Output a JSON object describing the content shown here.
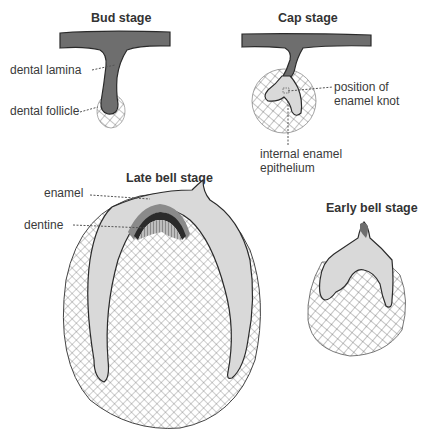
{
  "figure": {
    "stages": [
      {
        "id": "bud",
        "title": "Bud stage"
      },
      {
        "id": "cap",
        "title": "Cap stage"
      },
      {
        "id": "late-bell",
        "title": "Late bell stage"
      },
      {
        "id": "early-bell",
        "title": "Early bell stage"
      }
    ],
    "labels": {
      "dental_lamina": "dental lamina",
      "dental_follicle": "dental follicle",
      "enamel_knot_line1": "position of",
      "enamel_knot_line2": "enamel knot",
      "iee_line1": "internal enamel",
      "iee_line2": "epithelium",
      "enamel": "enamel",
      "dentine": "dentine"
    },
    "colors": {
      "epithelium_dark": "#6e6e6e",
      "enamel_organ_light": "#d9d9d9",
      "mesenchyme_hatch": "#555555",
      "outline": "#2a2a2a",
      "enamel_band": "#2b2b2b",
      "dentine_band": "#8a8a8a"
    }
  }
}
